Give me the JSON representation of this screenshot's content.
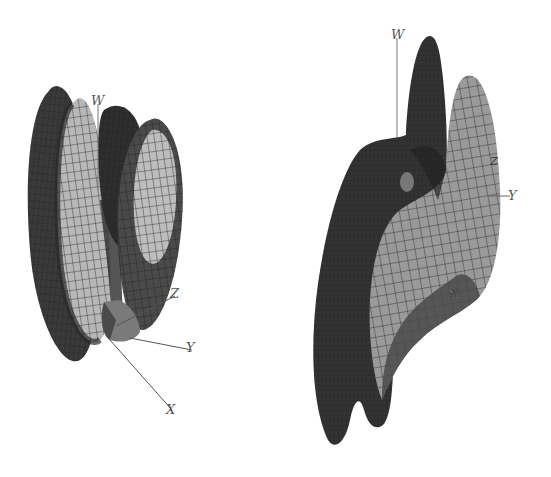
{
  "figures": [
    {
      "id": "left",
      "description": "Four-lobed 3D mesh surface with small cone at origin",
      "axes": {
        "w": "W",
        "z": "Z",
        "y": "Y",
        "x": "X"
      },
      "shading": {
        "dark": "#3a3a3a",
        "mid": "#6b6b6b",
        "light": "#bdbdbd",
        "edge": "#1e1e1e"
      }
    },
    {
      "id": "right",
      "description": "S-shaped folded 3D mesh surface with two upper peaks and two lower tails",
      "axes": {
        "w": "W",
        "z": "Z",
        "y": "Y",
        "x": "X"
      },
      "shading": {
        "dark": "#333333",
        "mid": "#707070",
        "light": "#b0b0b0",
        "edge": "#1e1e1e"
      }
    }
  ]
}
